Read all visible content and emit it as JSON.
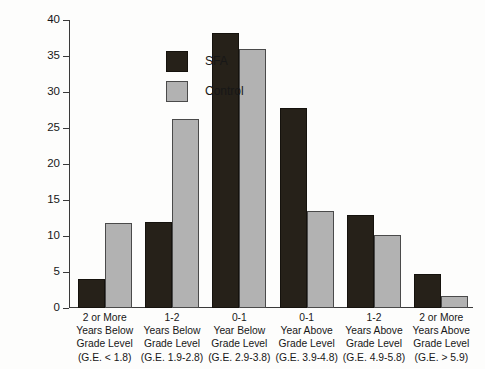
{
  "chart_data": {
    "type": "bar",
    "title": "",
    "xlabel": "",
    "ylabel": "Percent of Students",
    "ylim": [
      0,
      40
    ],
    "yticks": [
      0,
      5,
      10,
      15,
      20,
      25,
      30,
      35,
      40
    ],
    "grid": false,
    "legend_position": "top-left-inside",
    "categories": [
      "2 or More Years Below Grade Level (G.E. < 1.8)",
      "1-2 Years Below Grade Level (G.E. 1.9-2.8)",
      "0-1 Year Below Grade Level (G.E. 2.9-3.8)",
      "0-1 Year Above Grade Level (G.E. 3.9-4.8)",
      "1-2 Years Above Grade Level (G.E. 4.9-5.8)",
      "2 or More Years Above Grade Level (G.E. > 5.9)"
    ],
    "category_lines": [
      [
        "2 or More",
        "Years Below",
        "Grade Level",
        "(G.E. < 1.8)"
      ],
      [
        "1-2",
        "Years Below",
        "Grade Level",
        "(G.E. 1.9-2.8)"
      ],
      [
        "0-1",
        "Year Below",
        "Grade Level",
        "(G.E. 2.9-3.8)"
      ],
      [
        "0-1",
        "Year Above",
        "Grade Level",
        "(G.E. 3.9-4.8)"
      ],
      [
        "1-2",
        "Years Above",
        "Grade Level",
        "(G.E. 4.9-5.8)"
      ],
      [
        "2 or More",
        "Years Above",
        "Grade Level",
        "(G.E. > 5.9)"
      ]
    ],
    "series": [
      {
        "name": "SFA",
        "color": "#262119",
        "values": [
          4.0,
          12.0,
          38.2,
          27.8,
          12.9,
          4.7
        ]
      },
      {
        "name": "Control",
        "color": "#b2b2b2",
        "values": [
          11.8,
          26.3,
          36.0,
          13.5,
          10.1,
          1.6
        ]
      }
    ]
  },
  "legend": {
    "items": [
      {
        "label": "SFA"
      },
      {
        "label": "Control"
      }
    ]
  }
}
